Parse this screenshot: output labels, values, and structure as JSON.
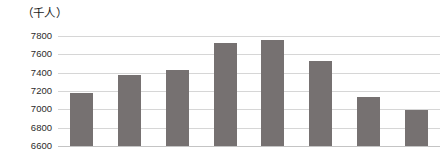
{
  "chart": {
    "axis_title": "（千人）",
    "background_color": "#ffffff",
    "bar_color": "#767171",
    "gridline_color": "#d6d6d6",
    "tick_text_color": "#2b2b2b"
  },
  "chart_data": {
    "type": "bar",
    "title": "",
    "xlabel": "",
    "ylabel": "（千人）",
    "categories": [
      "1",
      "2",
      "3",
      "4",
      "5",
      "6",
      "7",
      "8"
    ],
    "values": [
      7175,
      7380,
      7425,
      7720,
      7755,
      7525,
      7140,
      6995
    ],
    "ylim": [
      6600,
      7800
    ],
    "yticks": [
      6600,
      6800,
      7000,
      7200,
      7400,
      7600,
      7800
    ],
    "ytick_labels": [
      "6600",
      "6800",
      "7000",
      "7200",
      "7400",
      "7600",
      "7800"
    ],
    "grid": true,
    "legend": false,
    "xtick_labels": [
      "",
      "",
      "",
      "",
      "",
      "",
      "",
      ""
    ]
  }
}
